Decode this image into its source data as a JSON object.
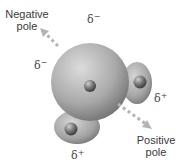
{
  "diagram": {
    "type": "water molecule dipole",
    "labels": {
      "negative_pole": [
        "Negative",
        "pole"
      ],
      "positive_pole": [
        "Positive",
        "pole"
      ]
    },
    "partial_charges": {
      "oxygen_top": {
        "symbol": "δ",
        "sign": "−"
      },
      "oxygen_left": {
        "symbol": "δ",
        "sign": "−"
      },
      "hydrogen_right": {
        "symbol": "δ",
        "sign": "+"
      },
      "hydrogen_bottom": {
        "symbol": "δ",
        "sign": "+"
      }
    },
    "arrow": {
      "style": "dashed",
      "color": "#b0b0b0",
      "direction": "negative-to-positive"
    },
    "colors": {
      "sphere_light": "#d8d8d8",
      "sphere_dark": "#7a7a7a",
      "nucleus": "#6a6a6a"
    }
  }
}
